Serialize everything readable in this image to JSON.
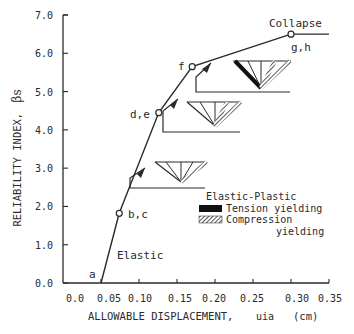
{
  "chart_data": {
    "type": "line",
    "title": "",
    "xlabel": "ALLOWABLE DISPLACEMENT,",
    "xlabel_symbol": "uia",
    "xlabel_unit": "(cm)",
    "ylabel": "RELIABILITY INDEX,",
    "ylabel_symbol": "βs",
    "xlim": [
      0.0,
      0.35
    ],
    "ylim": [
      0.0,
      7.0
    ],
    "x_ticks": [
      "0.0",
      "0.05",
      "0.10",
      "0.15",
      "0.20",
      "0.25",
      "0.30",
      "0.35"
    ],
    "y_ticks": [
      "0.0",
      "1.0",
      "2.0",
      "3.0",
      "4.0",
      "5.0",
      "6.0",
      "7.0"
    ],
    "grid": false,
    "series": [
      {
        "name": "Reliability index vs allowable displacement",
        "x": [
          0.05,
          0.074,
          0.126,
          0.17,
          0.3,
          0.35
        ],
        "y": [
          0.0,
          1.82,
          4.45,
          5.65,
          6.5,
          6.5
        ]
      }
    ],
    "points": [
      {
        "label": "a",
        "x": 0.05,
        "y": 0.0,
        "marker": false
      },
      {
        "label": "b,c",
        "x": 0.074,
        "y": 1.82,
        "marker": true
      },
      {
        "label": "d,e",
        "x": 0.126,
        "y": 4.45,
        "marker": true
      },
      {
        "label": "f",
        "x": 0.17,
        "y": 5.65,
        "marker": true
      },
      {
        "label": "g,h",
        "x": 0.3,
        "y": 6.5,
        "marker": true
      }
    ],
    "annotations": [
      "Elastic",
      "Collapse",
      "Elastic-Plastic"
    ],
    "legend": {
      "title": "Elastic-Plastic",
      "entries": [
        {
          "label": "Tension yielding",
          "pattern": "solid-black"
        },
        {
          "label": "Compression yielding",
          "pattern": "hatched"
        }
      ],
      "position": "lower-right"
    }
  },
  "labels": {
    "elastic": "Elastic",
    "collapse": "Collapse",
    "legend_title": "Elastic-Plastic",
    "legend_tension": "Tension yielding",
    "legend_compression_1": "Compression",
    "legend_compression_2": "yielding"
  },
  "colors": {
    "ink": "#2a2a2a",
    "background": "#ffffff"
  }
}
